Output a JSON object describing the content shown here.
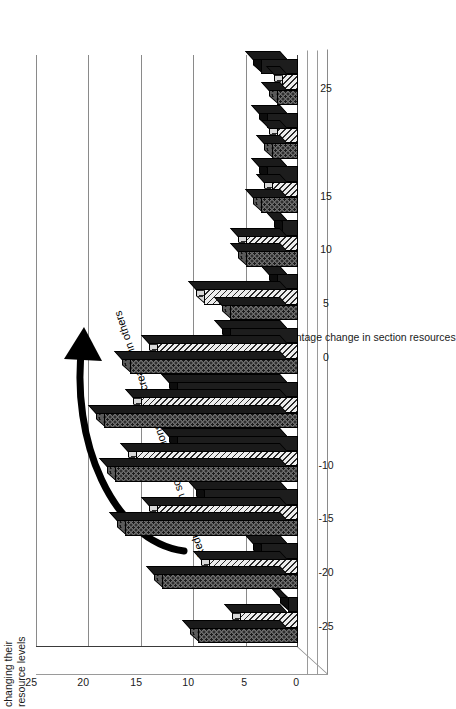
{
  "chart_data": {
    "type": "bar",
    "title": "",
    "subtitle": "",
    "orientation": "vertical-3d",
    "xlabel": "Percentage change in section resources",
    "ylabel": "changing their resource levels",
    "ylabel_lines": [
      "changing their",
      "resource levels"
    ],
    "ylim": [
      0,
      25
    ],
    "ytick_values": [
      0,
      5,
      10,
      15,
      20,
      25
    ],
    "ytick_labels": [
      "0",
      "5",
      "10",
      "15",
      "20",
      "25"
    ],
    "grid": true,
    "grid_axis": "y",
    "legend": "none",
    "xlim": [
      -27.5,
      27.5
    ],
    "xtick_values": [
      -25,
      -20,
      -15,
      -10,
      -5,
      0,
      5,
      10,
      15,
      20,
      25
    ],
    "xtick_labels": [
      "-25",
      "-20",
      "-15",
      "-10",
      "",
      "0",
      "5",
      "10",
      "15",
      "",
      "25"
    ],
    "categories": [
      -25,
      -20,
      -15,
      -10,
      -5,
      0,
      5,
      10,
      15,
      20,
      25
    ],
    "series": [
      {
        "name": "series-dotted",
        "pattern": "dotted",
        "color": "#6e6e6e",
        "values": [
          9.5,
          13.0,
          16.5,
          17.5,
          18.5,
          16.0,
          6.5,
          5.0,
          3.5,
          2.5,
          2.0
        ]
      },
      {
        "name": "series-hatched",
        "pattern": "diagonal-hatch",
        "color": "#ededed",
        "values": [
          5.5,
          8.5,
          13.5,
          15.5,
          15.0,
          13.5,
          9.0,
          5.0,
          2.5,
          2.0,
          1.5
        ]
      },
      {
        "name": "series-solid",
        "pattern": "solid",
        "color": "#1d1d1d",
        "values": [
          1.0,
          3.5,
          9.0,
          11.5,
          11.5,
          6.5,
          2.0,
          1.5,
          3.0,
          3.0,
          3.5
        ]
      }
    ],
    "annotations": [
      {
        "name": "reductions-callout",
        "text": "Reductions in some sections fund increases in others",
        "arrow": "curved-up-right"
      }
    ]
  },
  "axis_titles": {
    "x": "Percentage change in section resources",
    "y_line1": "changing their",
    "y_line2": "resource levels"
  }
}
